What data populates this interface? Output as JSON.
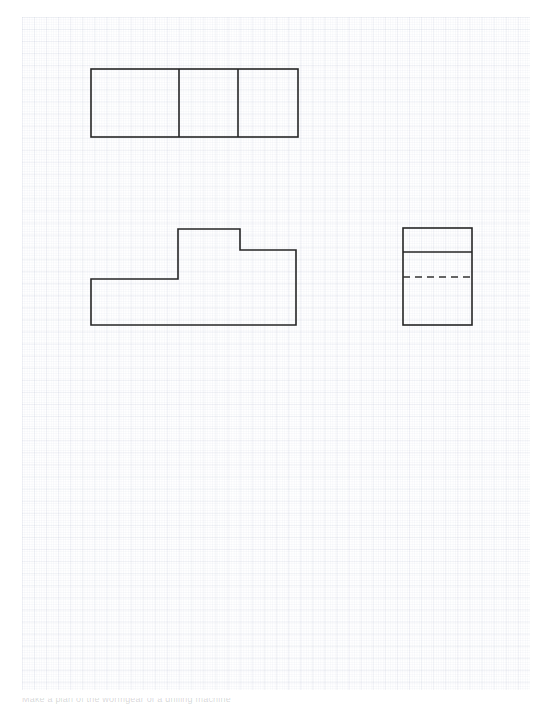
{
  "document": {
    "title": "Orthographic Projection Worksheet",
    "medium": "graph-paper",
    "caption": "Make a plan of the wormgear of a drilling machine",
    "paper": {
      "background_color": "#ffffff",
      "grid_major_color": "#96a0be",
      "grid_minor_color": "#8c96b9",
      "grid_major_pitch_px": 12.1,
      "grid_minor_pitch_px": 2.42,
      "left": 22,
      "top": 17,
      "width": 508,
      "height": 673
    },
    "line_style": {
      "visible_edge_color": "#262626",
      "visible_edge_width": 1.6,
      "hidden_edge_color": "#333333",
      "hidden_edge_width": 1.3,
      "hidden_dash_pattern": "7,5"
    }
  },
  "views": [
    {
      "name": "top-view",
      "label": "Top View",
      "shape": "rectangle-with-two-dividers",
      "outline": {
        "x": 91,
        "y": 69,
        "width": 207,
        "height": 68
      },
      "internal_lines": [
        {
          "type": "vertical",
          "x": 179,
          "y1": 69,
          "y2": 137
        },
        {
          "type": "vertical",
          "x": 238,
          "y1": 69,
          "y2": 137
        }
      ]
    },
    {
      "name": "front-view",
      "label": "Front View",
      "shape": "stepped-polygon",
      "points": "91,279 178,279 178,229 240,229 240,250 296,250 296,325 91,325",
      "vertices": [
        {
          "x": 91,
          "y": 279
        },
        {
          "x": 178,
          "y": 279
        },
        {
          "x": 178,
          "y": 229
        },
        {
          "x": 240,
          "y": 229
        },
        {
          "x": 240,
          "y": 250
        },
        {
          "x": 296,
          "y": 250
        },
        {
          "x": 296,
          "y": 325
        },
        {
          "x": 91,
          "y": 325
        }
      ]
    },
    {
      "name": "side-view",
      "label": "Right Side View",
      "shape": "rectangle-with-solid-and-hidden-line",
      "outline": {
        "x": 403,
        "y": 228,
        "width": 69,
        "height": 97
      },
      "internal_lines": [
        {
          "type": "horizontal-visible",
          "y": 252,
          "x1": 403,
          "x2": 472
        },
        {
          "type": "horizontal-hidden",
          "y": 277,
          "x1": 403,
          "x2": 472
        }
      ]
    }
  ]
}
